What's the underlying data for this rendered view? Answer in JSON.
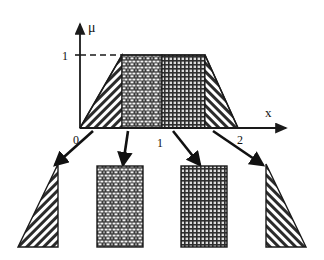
{
  "figure": {
    "kind": "fuzzy-membership-trapezoid-with-callouts",
    "background_color": "#ffffff",
    "ink_color": "#1a1a1a"
  },
  "axes": {
    "y_axis_label": "μ",
    "x_axis_label": "x",
    "y_ticks": [
      {
        "label": "1",
        "value": 1
      }
    ],
    "x_ticks": [
      {
        "label": "0",
        "value": 0
      },
      {
        "label": "1",
        "value": 1
      },
      {
        "label": "2",
        "value": 2
      }
    ],
    "dashed_guide_at": "1",
    "x_origin_px": 80,
    "x_unit_px": 79,
    "baseline_y_px": 128,
    "plateau_y_px": 55,
    "y_axis_top_px": 20,
    "x_axis_end_px": 292
  },
  "membership_function": {
    "type": "trapezoid",
    "breakpoints": [
      {
        "x": 0.0,
        "mu": 0
      },
      {
        "x": 0.53,
        "mu": 1
      },
      {
        "x": 1.58,
        "mu": 1
      },
      {
        "x": 2.0,
        "mu": 0
      }
    ],
    "plateau_height": 1
  },
  "regions": [
    {
      "id": "region-left-rising",
      "name": "left rising edge",
      "shape": "triangle",
      "fill_pattern": "diagonal-hatch-up",
      "x_from_px": 80,
      "x_to_px": 122
    },
    {
      "id": "region-left-plateau",
      "name": "left plateau block",
      "shape": "rectangle",
      "fill_pattern": "brick",
      "x_from_px": 122,
      "x_to_px": 162
    },
    {
      "id": "region-right-plateau",
      "name": "right plateau block",
      "shape": "rectangle",
      "fill_pattern": "fine-grid",
      "x_from_px": 162,
      "x_to_px": 205
    },
    {
      "id": "region-right-falling",
      "name": "right falling edge",
      "shape": "triangle",
      "fill_pattern": "diagonal-hatch-down",
      "x_from_px": 205,
      "x_to_px": 238
    }
  ],
  "callouts": [
    {
      "id": "callout-left-triangle",
      "source_px": {
        "x": 93,
        "y": 130
      },
      "target_px": {
        "x": 51,
        "y": 166
      },
      "shape": "triangle",
      "fill_pattern": "diagonal-hatch-up",
      "box_px": {
        "x": 18,
        "y": 163,
        "w": 40,
        "h": 84
      }
    },
    {
      "id": "callout-brick-rectangle",
      "source_px": {
        "x": 128,
        "y": 130
      },
      "target_px": {
        "x": 124,
        "y": 167
      },
      "shape": "rectangle",
      "fill_pattern": "brick",
      "box_px": {
        "x": 97,
        "y": 166,
        "w": 46,
        "h": 81
      }
    },
    {
      "id": "callout-grid-rectangle",
      "source_px": {
        "x": 173,
        "y": 130
      },
      "target_px": {
        "x": 199,
        "y": 167
      },
      "shape": "rectangle",
      "fill_pattern": "fine-grid",
      "box_px": {
        "x": 181,
        "y": 166,
        "w": 46,
        "h": 81
      }
    },
    {
      "id": "callout-right-triangle",
      "source_px": {
        "x": 213,
        "y": 130
      },
      "target_px": {
        "x": 265,
        "y": 166
      },
      "shape": "triangle",
      "fill_pattern": "diagonal-hatch-down",
      "box_px": {
        "x": 265,
        "y": 163,
        "w": 42,
        "h": 84
      }
    }
  ]
}
